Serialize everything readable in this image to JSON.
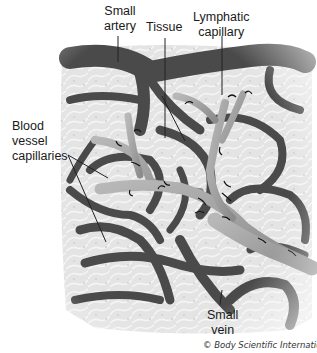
{
  "diagram": {
    "labels": {
      "small_artery": [
        "Small",
        "artery"
      ],
      "tissue": [
        "Tissue"
      ],
      "lymphatic_capillary": [
        "Lymphatic",
        "capillary"
      ],
      "blood_vessel_capillaries": [
        "Blood",
        "vessel",
        "capillaries"
      ],
      "small_vein": [
        "Small",
        "vein"
      ]
    },
    "credit": "© Body Scientific International",
    "colors": {
      "vessel": "#4a4a4a",
      "vessel_highlight": "#7a7a7a",
      "tissue": "#e6e6e6",
      "tissue_cell": "#f4f4f4",
      "lymph": "#9a9a9a",
      "lymph_highlight": "#c4c4c4",
      "arrow": "#111111",
      "leader_line": "#222222"
    }
  }
}
